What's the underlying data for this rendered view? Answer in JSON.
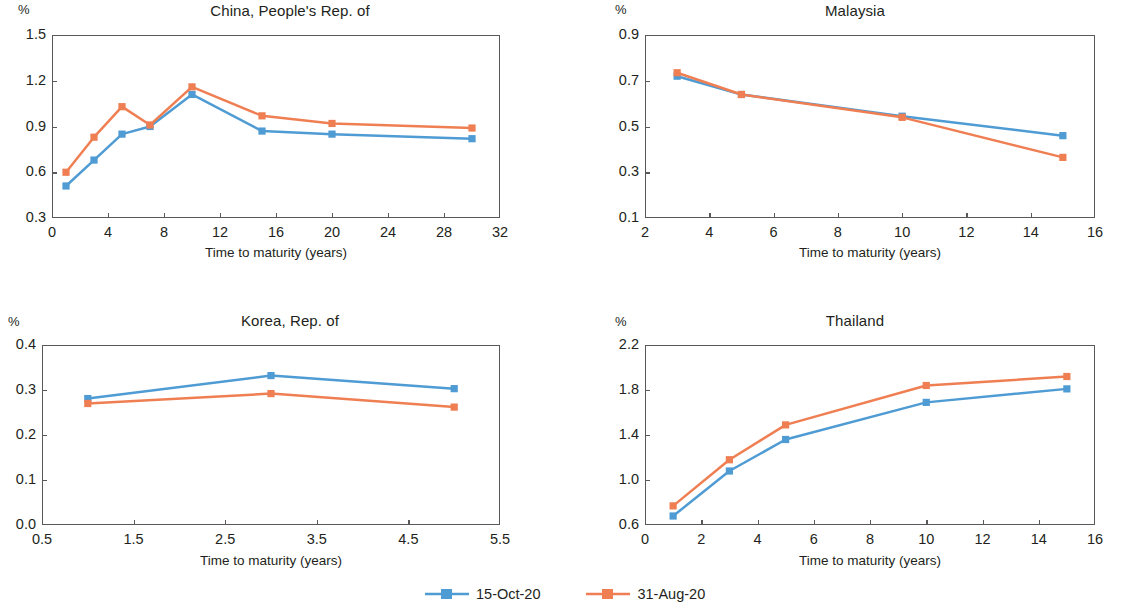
{
  "figure": {
    "axis_title": "Time to maturity (years)",
    "unit_label": "%",
    "colors": {
      "series_1": "#4f9bd3",
      "series_2": "#ef7f53",
      "axis": "#58595b",
      "text": "#231f20"
    }
  },
  "legend": {
    "position": "bottom-center",
    "entries": [
      {
        "label": "15-Oct-20",
        "color": "#4f9bd3"
      },
      {
        "label": "31-Aug-20",
        "color": "#ef7f53"
      }
    ]
  },
  "chart_data": [
    {
      "type": "line",
      "title": "China, People's Rep. of",
      "xlabel": "Time to maturity (years)",
      "ylabel": "%",
      "xlim": [
        0,
        32
      ],
      "ylim": [
        0.3,
        1.5
      ],
      "xticks": [
        0,
        4,
        8,
        12,
        16,
        20,
        24,
        28,
        32
      ],
      "yticks": [
        0.3,
        0.6,
        0.9,
        1.2,
        1.5
      ],
      "grid": false,
      "x": [
        1,
        3,
        5,
        7,
        10,
        15,
        20,
        30
      ],
      "series": [
        {
          "name": "15-Oct-20",
          "color": "#4f9bd3",
          "values": [
            0.51,
            0.68,
            0.85,
            0.9,
            1.11,
            0.87,
            0.85,
            0.82
          ]
        },
        {
          "name": "31-Aug-20",
          "color": "#ef7f53",
          "values": [
            0.6,
            0.83,
            1.03,
            0.91,
            1.16,
            0.97,
            0.92,
            0.89
          ]
        }
      ]
    },
    {
      "type": "line",
      "title": "Malaysia",
      "xlabel": "Time to maturity (years)",
      "ylabel": "%",
      "xlim": [
        2,
        16
      ],
      "ylim": [
        0.1,
        0.9
      ],
      "xticks": [
        2,
        4,
        6,
        8,
        10,
        12,
        14,
        16
      ],
      "yticks": [
        0.1,
        0.3,
        0.5,
        0.7,
        0.9
      ],
      "grid": false,
      "x": [
        3,
        5,
        10,
        15
      ],
      "series": [
        {
          "name": "15-Oct-20",
          "color": "#4f9bd3",
          "values": [
            0.72,
            0.64,
            0.545,
            0.46
          ]
        },
        {
          "name": "31-Aug-20",
          "color": "#ef7f53",
          "values": [
            0.735,
            0.64,
            0.54,
            0.365
          ]
        }
      ]
    },
    {
      "type": "line",
      "title": "Korea, Rep. of",
      "xlabel": "Time to maturity (years)",
      "ylabel": "%",
      "xlim": [
        0.5,
        5.5
      ],
      "ylim": [
        0.0,
        0.4
      ],
      "xticks": [
        0.5,
        1.5,
        2.5,
        3.5,
        4.5,
        5.5
      ],
      "yticks": [
        0.0,
        0.1,
        0.2,
        0.3,
        0.4
      ],
      "grid": false,
      "x": [
        1,
        3,
        5
      ],
      "series": [
        {
          "name": "15-Oct-20",
          "color": "#4f9bd3",
          "values": [
            0.281,
            0.332,
            0.303
          ]
        },
        {
          "name": "31-Aug-20",
          "color": "#ef7f53",
          "values": [
            0.27,
            0.292,
            0.262
          ]
        }
      ]
    },
    {
      "type": "line",
      "title": "Thailand",
      "xlabel": "Time to maturity (years)",
      "ylabel": "%",
      "xlim": [
        0,
        16
      ],
      "ylim": [
        0.6,
        2.2
      ],
      "xticks": [
        0,
        2,
        4,
        6,
        8,
        10,
        12,
        14,
        16
      ],
      "yticks": [
        0.6,
        1.0,
        1.4,
        1.8,
        2.2
      ],
      "grid": false,
      "x": [
        1,
        3,
        5,
        10,
        15
      ],
      "series": [
        {
          "name": "15-Oct-20",
          "color": "#4f9bd3",
          "values": [
            0.68,
            1.08,
            1.36,
            1.69,
            1.81
          ]
        },
        {
          "name": "31-Aug-20",
          "color": "#ef7f53",
          "values": [
            0.77,
            1.18,
            1.49,
            1.84,
            1.92
          ]
        }
      ]
    }
  ]
}
